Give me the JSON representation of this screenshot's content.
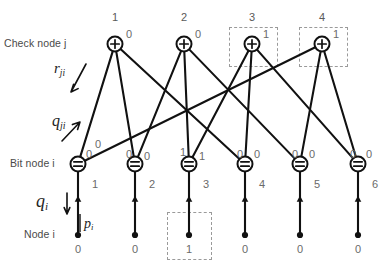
{
  "diagram": {
    "title_row_labels": {
      "check_node": "Check node j",
      "bit_node": "Bit node i",
      "node": "Node i"
    },
    "message_symbols": {
      "r_ji": {
        "base": "r",
        "sub": "ji"
      },
      "q_ji": {
        "base": "q",
        "sub": "ji"
      },
      "q_i": {
        "base": "q",
        "sub": "i"
      },
      "p_i": {
        "base": "p",
        "sub": "i"
      }
    },
    "check_nodes": [
      {
        "index": "1",
        "value": "0",
        "x": 115,
        "y": 44,
        "highlighted": false
      },
      {
        "index": "2",
        "value": "0",
        "x": 184,
        "y": 44,
        "highlighted": false
      },
      {
        "index": "3",
        "value": "1",
        "x": 252,
        "y": 44,
        "highlighted": true
      },
      {
        "index": "4",
        "value": "1",
        "x": 322,
        "y": 44,
        "highlighted": true
      }
    ],
    "check_node_glyph": "plus-glyph",
    "bit_nodes": [
      {
        "index": "1",
        "x": 78,
        "y": 164
      },
      {
        "index": "2",
        "x": 135,
        "y": 164
      },
      {
        "index": "3",
        "x": 189,
        "y": 164
      },
      {
        "index": "4",
        "x": 245,
        "y": 164
      },
      {
        "index": "5",
        "x": 300,
        "y": 164
      },
      {
        "index": "6",
        "x": 358,
        "y": 164
      }
    ],
    "bit_node_glyph": "equals-glyph",
    "source_nodes": [
      {
        "index": "1",
        "value": "0",
        "x": 78,
        "y": 235,
        "highlighted": false
      },
      {
        "index": "2",
        "value": "0",
        "x": 135,
        "y": 235,
        "highlighted": false
      },
      {
        "index": "3",
        "value": "1",
        "x": 189,
        "y": 235,
        "highlighted": true
      },
      {
        "index": "4",
        "value": "0",
        "x": 245,
        "y": 235,
        "highlighted": false
      },
      {
        "index": "5",
        "value": "0",
        "x": 300,
        "y": 235,
        "highlighted": false
      },
      {
        "index": "6",
        "value": "0",
        "x": 358,
        "y": 235,
        "highlighted": false
      }
    ],
    "edges": [
      {
        "check": 1,
        "bit": 1,
        "q_label": "0",
        "lx": 86,
        "ly": 148
      },
      {
        "check": 1,
        "bit": 2,
        "q_label": "0",
        "lx": 126,
        "ly": 148
      },
      {
        "check": 1,
        "bit": 4,
        "q_label": "0",
        "lx": 237,
        "ly": 148
      },
      {
        "check": 2,
        "bit": 2,
        "q_label": "0",
        "lx": 144,
        "ly": 150
      },
      {
        "check": 2,
        "bit": 3,
        "q_label": "1",
        "lx": 180,
        "ly": 146
      },
      {
        "check": 2,
        "bit": 5,
        "q_label": "0",
        "lx": 292,
        "ly": 148
      },
      {
        "check": 3,
        "bit": 3,
        "q_label": "1",
        "lx": 199,
        "ly": 150
      },
      {
        "check": 3,
        "bit": 4,
        "q_label": "0",
        "lx": 254,
        "ly": 148
      },
      {
        "check": 3,
        "bit": 6,
        "q_label": "0",
        "lx": 350,
        "ly": 148
      },
      {
        "check": 4,
        "bit": 1,
        "q_label": "0",
        "lx": 95,
        "ly": 138
      },
      {
        "check": 4,
        "bit": 5,
        "q_label": "0",
        "lx": 309,
        "ly": 148
      },
      {
        "check": 4,
        "bit": 6,
        "q_label": "0",
        "lx": 366,
        "ly": 148
      }
    ],
    "bit_node_side_values": [
      {
        "value": "1",
        "x": 92,
        "y": 178
      },
      {
        "value": "2",
        "x": 149,
        "y": 178
      },
      {
        "value": "3",
        "x": 203,
        "y": 178
      },
      {
        "value": "4",
        "x": 259,
        "y": 178
      },
      {
        "value": "5",
        "x": 314,
        "y": 178
      },
      {
        "value": "6",
        "x": 372,
        "y": 178
      }
    ],
    "highlight_boxes": [
      {
        "name": "check-node-3-box",
        "x": 229,
        "y": 27,
        "w": 49,
        "h": 40
      },
      {
        "name": "check-node-4-box",
        "x": 299,
        "y": 27,
        "w": 49,
        "h": 40
      },
      {
        "name": "bit-value-3-box",
        "x": 167,
        "y": 212,
        "w": 45,
        "h": 48
      }
    ],
    "colors": {
      "line": "#111111",
      "node_stroke": "#111111",
      "label_gray": "#6a6a6a",
      "dashed_box": "#9a9a9a",
      "background": "#ffffff"
    }
  }
}
